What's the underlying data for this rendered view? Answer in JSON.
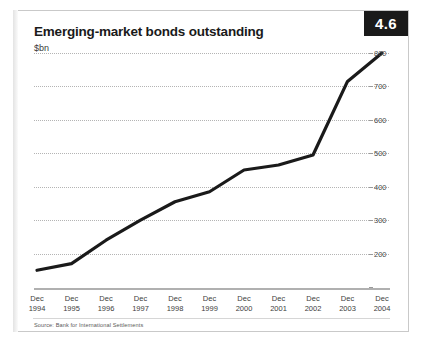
{
  "figure": {
    "badge_number": "4.6",
    "title": "Emerging-market bonds outstanding",
    "subtitle": "$bn",
    "source": "Source: Bank for International Settlements",
    "accent_color": "#1a1a1a",
    "line_color": "#1a1a1a",
    "grid_color": "#b4b4b4",
    "frame_color": "#c9c9c9"
  },
  "chart_data": {
    "type": "line",
    "title": "Emerging-market bonds outstanding",
    "subtitle": "$bn",
    "xlabel": "",
    "ylabel": "$bn",
    "categories": [
      "Dec 1994",
      "Dec 1995",
      "Dec 1996",
      "Dec 1997",
      "Dec 1998",
      "Dec 1999",
      "Dec 2000",
      "Dec 2001",
      "Dec 2002",
      "Dec 2003",
      "Dec 2004"
    ],
    "category_lines": [
      [
        "Dec",
        "1994"
      ],
      [
        "Dec",
        "1995"
      ],
      [
        "Dec",
        "1996"
      ],
      [
        "Dec",
        "1997"
      ],
      [
        "Dec",
        "1998"
      ],
      [
        "Dec",
        "1999"
      ],
      [
        "Dec",
        "2000"
      ],
      [
        "Dec",
        "2001"
      ],
      [
        "Dec",
        "2002"
      ],
      [
        "Dec",
        "2003"
      ],
      [
        "Dec",
        "2004"
      ]
    ],
    "values": [
      150,
      170,
      240,
      300,
      355,
      385,
      450,
      465,
      495,
      715,
      800
    ],
    "ylim": [
      100,
      800
    ],
    "yticks": [
      200,
      300,
      400,
      500,
      600,
      700,
      800
    ],
    "ytick_labels": [
      "200",
      "300",
      "400",
      "500",
      "600",
      "700",
      "800"
    ],
    "grid": true,
    "grid_axis": "y",
    "legend": "none",
    "series": [
      {
        "name": "Emerging-market bonds outstanding",
        "values": [
          150,
          170,
          240,
          300,
          355,
          385,
          450,
          465,
          495,
          715,
          800
        ]
      }
    ]
  }
}
